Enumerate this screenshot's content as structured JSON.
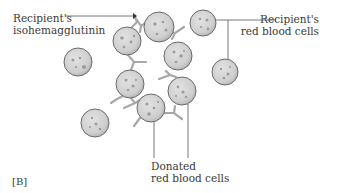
{
  "figure": {
    "panel_label": "[B]",
    "labels": {
      "isohemagglutinin": {
        "line1": "Recipient's",
        "line2": "isohemagglutinin"
      },
      "recipient_rbc": {
        "line1": "Recipient's",
        "line2": "red blood cells"
      },
      "donated_rbc": {
        "line1": "Donated",
        "line2": "red blood cells"
      }
    },
    "colors": {
      "cell_fill": "#d2d2d2",
      "cell_stroke": "#6a6a6a",
      "antibody": "#a8a8a8",
      "leader_line": "#555555",
      "text": "#3a3a3a"
    }
  }
}
